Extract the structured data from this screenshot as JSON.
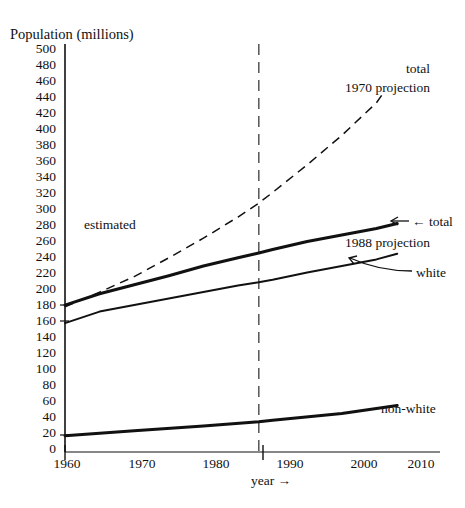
{
  "chart_data": {
    "type": "line",
    "title": "",
    "ylabel": "Population (millions)",
    "xlabel": "year →",
    "xlim": [
      1960,
      2010
    ],
    "ylim": [
      0,
      500
    ],
    "ytick_step": 20,
    "grid": false,
    "legend": "inline-annotations",
    "ytick_labels": [
      "500",
      "480",
      "460",
      "440",
      "420",
      "400",
      "380",
      "360",
      "340",
      "320",
      "300",
      "280",
      "260",
      "240",
      "220",
      "200",
      "180",
      "160",
      "140",
      "120",
      "100",
      "80",
      "60",
      "40",
      "20",
      "0"
    ],
    "xtick_labels": [
      "1960",
      "1970",
      "1980",
      "1990",
      "2000",
      "2010"
    ],
    "annotations": [
      {
        "id": "estimated",
        "text": "estimated",
        "x": 1966,
        "y": 290
      },
      {
        "id": "total-1970-projection-line1",
        "text": "total",
        "x": 2007,
        "y": 462
      },
      {
        "id": "total-1970-projection-line2",
        "text": "1970 projection",
        "x": 2000,
        "y": 440
      },
      {
        "id": "total-1988-projection-arrow-label",
        "text": "← total",
        "x": 2008,
        "y": 280
      },
      {
        "id": "total-1988-projection-line2",
        "text": "1988 projection",
        "x": 2000,
        "y": 258
      },
      {
        "id": "white-label",
        "text": "white",
        "x": 2009,
        "y": 222
      },
      {
        "id": "non-white-label",
        "text": "non-white",
        "x": 2004,
        "y": 60
      }
    ],
    "vertical_reference_line": {
      "x": 1988,
      "style": "dashed",
      "label": "1988 divider between estimated and projected"
    },
    "series": [
      {
        "name": "total 1970 projection",
        "style": "dashed",
        "x": [
          1960,
          1965,
          1970,
          1975,
          1980,
          1985,
          1988,
          1990,
          1995,
          2000,
          2005,
          2006
        ],
        "values": [
          178,
          196,
          215,
          238,
          262,
          288,
          305,
          318,
          352,
          388,
          428,
          440
        ]
      },
      {
        "name": "total 1988 projection",
        "style": "solid-thick",
        "x": [
          1960,
          1965,
          1970,
          1975,
          1980,
          1985,
          1988,
          1990,
          1995,
          2000,
          2005,
          2008
        ],
        "values": [
          180,
          194,
          205,
          216,
          228,
          238,
          244,
          248,
          258,
          266,
          274,
          280
        ]
      },
      {
        "name": "white",
        "style": "solid",
        "x": [
          1960,
          1965,
          1970,
          1975,
          1980,
          1985,
          1988,
          1990,
          1995,
          2000,
          2005,
          2008
        ],
        "values": [
          158,
          172,
          180,
          188,
          196,
          204,
          208,
          211,
          220,
          228,
          236,
          243
        ]
      },
      {
        "name": "non-white",
        "style": "solid-thick",
        "x": [
          1960,
          1970,
          1980,
          1988,
          1990,
          2000,
          2008
        ],
        "values": [
          20,
          26,
          32,
          37,
          39,
          47,
          57
        ]
      }
    ]
  }
}
